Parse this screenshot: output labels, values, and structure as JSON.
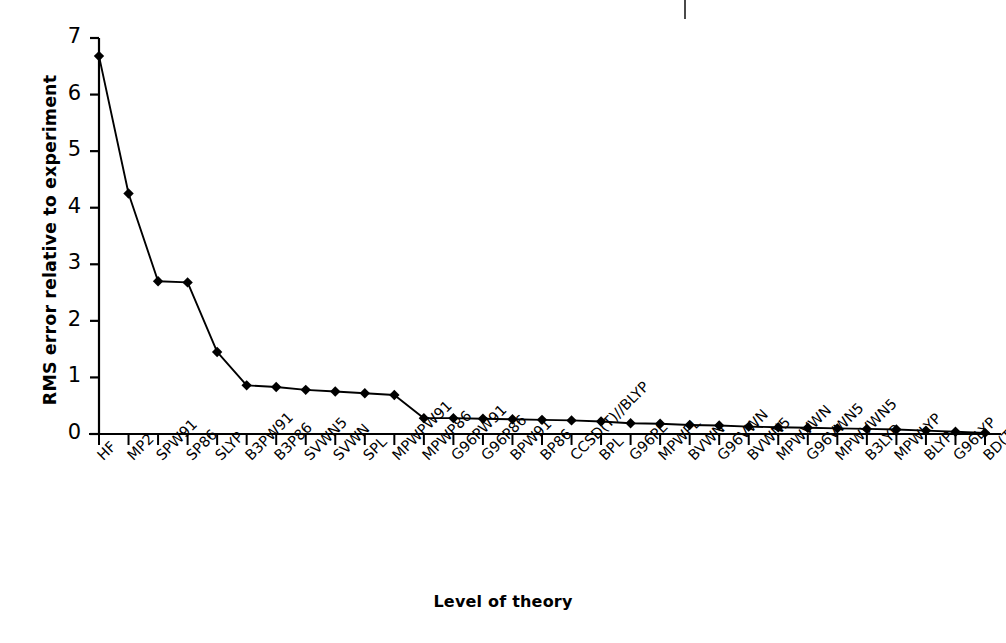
{
  "chart_data": {
    "type": "line",
    "title": "",
    "xlabel": "Level of theory",
    "ylabel": "RMS error relative to experiment",
    "ylim": [
      0,
      7
    ],
    "yticks": [
      0,
      1,
      2,
      3,
      4,
      5,
      6,
      7
    ],
    "ytick_labels": [
      "0",
      "1",
      "2",
      "3",
      "4",
      "5",
      "6",
      "7"
    ],
    "grid": false,
    "legend": "none",
    "marker": "diamond",
    "marker_color": "#000000",
    "line_color": "#000000",
    "categories": [
      "HF",
      "MP2",
      "SPW91",
      "SP86",
      "SLYP",
      "B3PW91",
      "B3P86",
      "SVWN5",
      "SVWN",
      "SPL",
      "MPWPW91",
      "MPWP86",
      "G96PW91",
      "G96P86",
      "BPW91",
      "BP86",
      "CCSD(T)//BLYP",
      "BPL",
      "G96PL",
      "MPWPL",
      "BVWN",
      "G96VWN",
      "BVWN5",
      "MPWVWN",
      "G96VWN5",
      "MPWVWN5",
      "B3LYP",
      "MPWLYP",
      "BLYP",
      "G96LYP",
      "BD(T)//BLYP"
    ],
    "values": [
      6.68,
      4.25,
      2.7,
      2.68,
      1.45,
      0.86,
      0.83,
      0.78,
      0.75,
      0.72,
      0.69,
      0.28,
      0.28,
      0.27,
      0.26,
      0.25,
      0.24,
      0.22,
      0.19,
      0.18,
      0.16,
      0.15,
      0.13,
      0.12,
      0.11,
      0.1,
      0.09,
      0.08,
      0.06,
      0.04,
      0.02
    ]
  },
  "axis": {
    "y_title": "RMS error relative to experiment",
    "x_title": "Level of theory"
  }
}
